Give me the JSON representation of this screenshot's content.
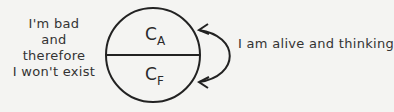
{
  "diagram": {
    "left_label": [
      "I'm bad",
      "and therefore",
      "I won't exist"
    ],
    "right_label": "I am alive and thinking",
    "top_symbol": {
      "base": "C",
      "sub": "A"
    },
    "bottom_symbol": {
      "base": "C",
      "sub": "F"
    }
  }
}
